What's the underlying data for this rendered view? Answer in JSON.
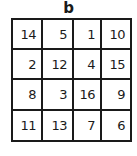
{
  "title": "b",
  "grid": {
    "rows": [
      [
        "14",
        "5",
        "1",
        "10"
      ],
      [
        "2",
        "12",
        "4",
        "15"
      ],
      [
        "8",
        "3",
        "16",
        "9"
      ],
      [
        "11",
        "13",
        "7",
        "6"
      ]
    ]
  }
}
